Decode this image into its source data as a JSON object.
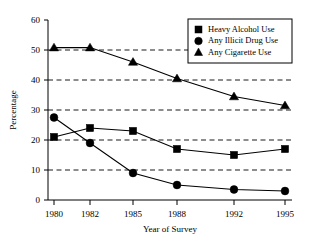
{
  "chart_data": {
    "type": "line",
    "title": "",
    "xlabel": "Year of Survey",
    "ylabel": "Percentage",
    "categories": [
      "1980",
      "1982",
      "1985",
      "1988",
      "1992",
      "1995"
    ],
    "x": [
      1980,
      1982,
      1985,
      1988,
      1992,
      1995
    ],
    "ylim": [
      0,
      60
    ],
    "yticks": [
      "0",
      "10",
      "20",
      "30",
      "40",
      "50",
      "60"
    ],
    "ytick_values": [
      0,
      10,
      20,
      30,
      40,
      50,
      60
    ],
    "grid": "horizontal-dashed",
    "legend_position": "top-right",
    "series": [
      {
        "name": "Heavy Alcohol Use",
        "marker": "square",
        "values": [
          21,
          24,
          23,
          17,
          15,
          17
        ]
      },
      {
        "name": "Any Illicit Drug Use",
        "marker": "circle",
        "values": [
          27.5,
          19,
          9,
          5,
          3.5,
          3
        ]
      },
      {
        "name": "Any Cigarette Use",
        "marker": "triangle",
        "values": [
          50.8,
          50.8,
          46,
          40.5,
          34.5,
          31.5
        ]
      }
    ]
  },
  "colors": {
    "ink": "#000000",
    "background": "#ffffff"
  }
}
